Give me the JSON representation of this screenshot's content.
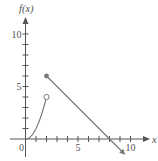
{
  "chart_data": {
    "type": "line",
    "title": "",
    "xlabel": "x",
    "ylabel": "f(x)",
    "xlim": [
      -1.5,
      11.5
    ],
    "ylim": [
      -1.5,
      12
    ],
    "x_ticks": [
      1,
      2,
      3,
      4,
      5,
      6,
      7,
      8,
      9,
      10
    ],
    "x_tick_labels": [
      {
        "value": 0,
        "label": "0"
      },
      {
        "value": 5,
        "label": "5"
      },
      {
        "value": 10,
        "label": "10"
      }
    ],
    "y_ticks": [
      1,
      2,
      3,
      4,
      5,
      6,
      7,
      8,
      9,
      10
    ],
    "y_tick_labels": [
      {
        "value": 5,
        "label": "5"
      },
      {
        "value": 10,
        "label": "10"
      }
    ],
    "grid": false,
    "legend": null,
    "series": [
      {
        "name": "piece 1: f(x) = x^2",
        "domain": "0 <= x < 2",
        "points": [
          [
            0,
            0
          ],
          [
            0.5,
            0.25
          ],
          [
            1,
            1
          ],
          [
            1.5,
            2.25
          ],
          [
            2,
            4
          ]
        ],
        "endpoint": {
          "x": 2,
          "y": 4,
          "style": "open"
        }
      },
      {
        "name": "piece 2: f(x) = 8 - x",
        "domain": "x >= 2",
        "points": [
          [
            2,
            6
          ],
          [
            8,
            0
          ],
          [
            9.5,
            -1.5
          ]
        ],
        "startpoint": {
          "x": 2,
          "y": 6,
          "style": "filled"
        },
        "end_arrow": true
      }
    ],
    "colors": {
      "axis": "#555555",
      "curve": "#777777"
    }
  }
}
